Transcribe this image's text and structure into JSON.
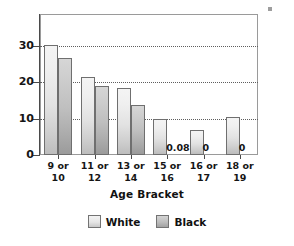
{
  "chart_data": {
    "type": "bar",
    "title": "",
    "xlabel": "Age Bracket",
    "ylabel": "",
    "categories": [
      "9 or 10",
      "11 or 12",
      "13 or 14",
      "15 or 16",
      "16 or 17",
      "18 or 19"
    ],
    "category_lines": [
      [
        "9 or",
        "10"
      ],
      [
        "11 or",
        "12"
      ],
      [
        "13 or",
        "14"
      ],
      [
        "15 or",
        "16"
      ],
      [
        "16 or",
        "17"
      ],
      [
        "18 or",
        "19"
      ]
    ],
    "series": [
      {
        "name": "White",
        "color": "#e8e8e8",
        "values": [
          30.2,
          21.6,
          18.4,
          9.9,
          6.9,
          10.4
        ],
        "labels": [
          "",
          "",
          "",
          "",
          "",
          ""
        ]
      },
      {
        "name": "Black",
        "color": "#bdbdbd",
        "values": [
          26.6,
          19.0,
          13.8,
          0.08,
          0,
          0
        ],
        "labels": [
          "",
          "",
          "",
          "0.08",
          "0",
          "0"
        ]
      }
    ],
    "ylim": [
      0,
      39
    ],
    "yticks": [
      0,
      10,
      20,
      30
    ],
    "ytick_labels": [
      "0",
      "10",
      "20",
      "30"
    ],
    "grid": true,
    "gridlines_at": [
      10,
      20,
      30
    ],
    "legend_position": "bottom"
  },
  "legend": {
    "entries": [
      {
        "label": "White",
        "swatch": "white"
      },
      {
        "label": "Black",
        "swatch": "black"
      }
    ]
  },
  "axis": {
    "x_title": "Age Bracket"
  }
}
